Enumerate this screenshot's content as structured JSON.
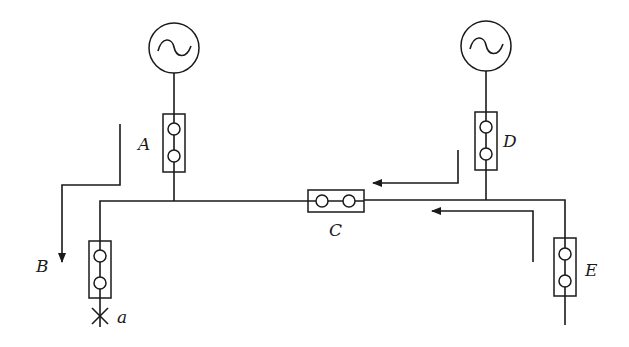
{
  "diagram": {
    "type": "power-system-single-line",
    "colors": {
      "line": "#1a1a1a",
      "background": "#ffffff"
    },
    "generators": [
      {
        "id": "gen-left",
        "symbol": "~"
      },
      {
        "id": "gen-right",
        "symbol": "~"
      }
    ],
    "breakers": {
      "A": "A",
      "C": "C",
      "D": "D",
      "E": "E"
    },
    "labels": {
      "B": "B",
      "fault": "a"
    },
    "flow_arrows": [
      {
        "id": "arrow-to-B",
        "direction": "down"
      },
      {
        "id": "arrow-from-D",
        "direction": "left"
      },
      {
        "id": "arrow-from-E",
        "direction": "left"
      }
    ]
  }
}
